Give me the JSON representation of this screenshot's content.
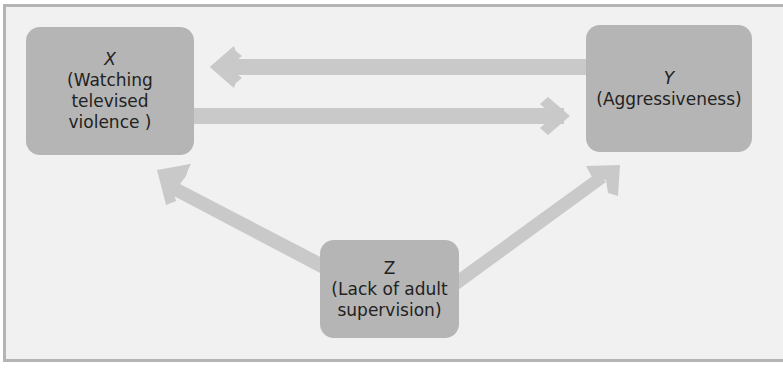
{
  "diagram": {
    "type": "causal-diagram",
    "nodes": {
      "x": {
        "symbol": "X",
        "label_line1": "(Watching",
        "label_line2": "televised",
        "label_line3": "violence )"
      },
      "y": {
        "symbol": "Y",
        "label_line1": "(Aggressiveness)"
      },
      "z": {
        "symbol": "Z",
        "label_line1": "(Lack of adult",
        "label_line2": "supervision)"
      }
    },
    "edges": [
      {
        "from": "Y",
        "to": "X",
        "direction": "left"
      },
      {
        "from": "X",
        "to": "Y",
        "direction": "right"
      },
      {
        "from": "Z",
        "to": "X",
        "direction": "up-left"
      },
      {
        "from": "Z",
        "to": "Y",
        "direction": "up-right"
      }
    ],
    "colors": {
      "frame_bg": "#f1f1f1",
      "frame_border": "#b4b4b4",
      "node_fill": "#b5b5b5",
      "arrow_fill": "#c9c9c9",
      "text": "#222222"
    }
  }
}
